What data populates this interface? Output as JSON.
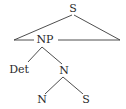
{
  "diagram": {
    "type": "syntax-tree",
    "line_color": "#3a3a3a",
    "nodes": [
      {
        "id": "s_root",
        "label": "S"
      },
      {
        "id": "np",
        "label": "NP"
      },
      {
        "id": "det",
        "label": "Det"
      },
      {
        "id": "n_mid",
        "label": "N"
      },
      {
        "id": "n_leaf",
        "label": "N"
      },
      {
        "id": "s_leaf",
        "label": "S"
      }
    ],
    "edges": [
      {
        "from": "s_root",
        "to": "triangle-left"
      },
      {
        "from": "s_root",
        "to": "triangle-right"
      },
      {
        "from": "np",
        "to": "det"
      },
      {
        "from": "np",
        "to": "n_mid"
      },
      {
        "from": "n_mid",
        "to": "n_leaf"
      },
      {
        "from": "n_mid",
        "to": "s_leaf"
      }
    ]
  }
}
